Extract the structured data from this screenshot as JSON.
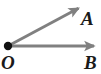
{
  "figure": {
    "name": "angle-AOB-diagram",
    "type": "geometry-angle",
    "background_color": "#ffffff",
    "width": 101,
    "height": 74,
    "ray_color": "#808080",
    "vertex_color": "#111111",
    "label_color": "#1a1a1a"
  },
  "vertex": {
    "label": "O",
    "x": 8,
    "y": 46,
    "dot_radius": 4.2
  },
  "rays": [
    {
      "name": "ray-OA",
      "label": "A",
      "from_x": 8,
      "from_y": 46,
      "to_x": 80,
      "to_y": 7,
      "color": "#808080",
      "stroke_width": 3,
      "arrowhead": true,
      "label_x": 81,
      "label_y": 9
    },
    {
      "name": "ray-OB",
      "label": "B",
      "from_x": 8,
      "from_y": 46,
      "to_x": 96,
      "to_y": 46,
      "color": "#808080",
      "stroke_width": 3,
      "arrowhead": true,
      "label_x": 84,
      "label_y": 53
    }
  ],
  "labels": {
    "vertex": "O",
    "ray_a": "A",
    "ray_b": "B"
  }
}
